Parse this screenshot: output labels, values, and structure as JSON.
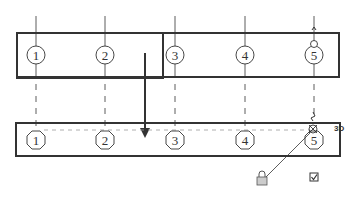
{
  "diagram": {
    "top_panel": {
      "markers": [
        {
          "label": "1",
          "x": 36,
          "shape": "circle"
        },
        {
          "label": "2",
          "x": 105,
          "shape": "circle"
        },
        {
          "label": "3",
          "x": 175,
          "shape": "circle"
        },
        {
          "label": "4",
          "x": 245,
          "shape": "circle"
        },
        {
          "label": "5",
          "x": 314,
          "shape": "circle"
        }
      ]
    },
    "bottom_panel": {
      "markers": [
        {
          "label": "1",
          "x": 36,
          "shape": "octagon"
        },
        {
          "label": "2",
          "x": 105,
          "shape": "octagon"
        },
        {
          "label": "3",
          "x": 175,
          "shape": "octagon"
        },
        {
          "label": "4",
          "x": 245,
          "shape": "octagon"
        },
        {
          "label": "5",
          "x": 314,
          "shape": "octagon"
        }
      ],
      "snap_label": "3D"
    },
    "icons": {
      "lock": "lock-icon",
      "checkbox": "checkbox-checked-icon",
      "arrow": "arrow-down-icon"
    },
    "colors": {
      "line": "#333333",
      "dashed": "#999999",
      "lock_fill": "#cccccc"
    }
  }
}
